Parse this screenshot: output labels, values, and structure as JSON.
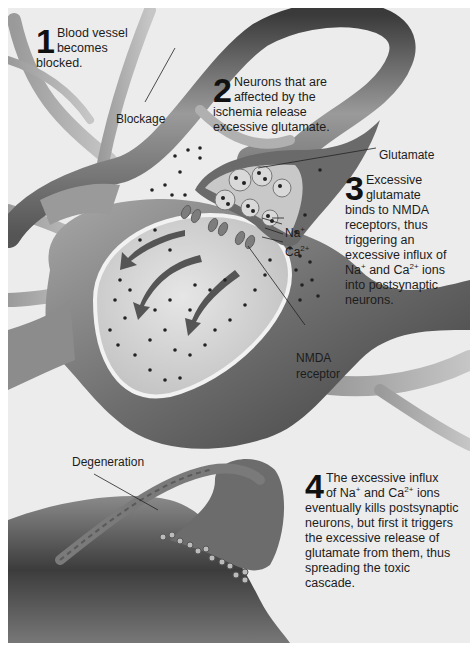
{
  "figure": {
    "steps": [
      {
        "number": "1",
        "first": "Blood vessel",
        "second": "becomes",
        "rest": "blocked."
      },
      {
        "number": "2",
        "first": "Neurons that are",
        "second": "affected by the",
        "rest_lines": [
          "ischemia release",
          "excessive glutamate."
        ]
      },
      {
        "number": "3",
        "first": "Excessive",
        "second": "glutamate",
        "rest_lines": [
          "binds to NMDA",
          "receptors, thus",
          "triggering an",
          "excessive influx of"
        ],
        "ion_line": {
          "na": "Na",
          "na_sup": "+",
          "and": " and ",
          "ca": "Ca",
          "ca_sup": "2+",
          "tail": " ions"
        },
        "tail_lines": [
          "into postsynaptic",
          "neurons."
        ]
      },
      {
        "number": "4",
        "first": "The excessive influx",
        "second_parts": {
          "pre": "of ",
          "na": "Na",
          "na_sup": "+",
          "and": " and ",
          "ca": "Ca",
          "ca_sup": "2+",
          "tail": " ions"
        },
        "rest_lines": [
          "eventually kills postsynaptic",
          "neurons, but first it triggers",
          "the excessive release of",
          "glutamate from them, thus",
          "spreading the toxic",
          "cascade."
        ]
      }
    ],
    "labels": {
      "blockage": "Blockage",
      "glutamate": "Glutamate",
      "na": "Na",
      "na_sup": "+",
      "ca": "Ca",
      "ca_sup": "2+",
      "nmda_line1": "NMDA",
      "nmda_line2": "receptor",
      "degeneration": "Degeneration"
    },
    "colors": {
      "background": "#ececec",
      "tissue_dark": "#4a4a4a",
      "tissue_mid": "#8a8a8a",
      "tissue_light": "#bdbdbd",
      "cytoplasm": "#d4d4d4",
      "dots": "#222222"
    }
  }
}
